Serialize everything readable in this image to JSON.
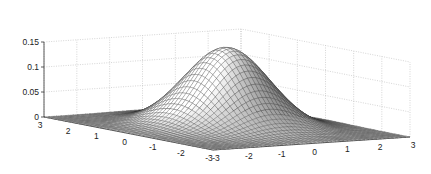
{
  "chart_data": {
    "type": "surface",
    "title": "",
    "xlabel": "",
    "ylabel": "",
    "zlabel": "",
    "function": "bivariate standard normal density z = exp(-(x^2+y^2)/2) / (2*pi)",
    "x_range": [
      -3,
      3
    ],
    "y_range": [
      -3,
      3
    ],
    "zlim": [
      0,
      0.15
    ],
    "grid_on": true,
    "mesh_resolution": 49,
    "x_ticks": [
      -3,
      -2,
      -1,
      0,
      1,
      2,
      3
    ],
    "x_tick_labels": [
      "-3",
      "-2",
      "-1",
      "0",
      "1",
      "2",
      "3"
    ],
    "y_ticks": [
      -3,
      -2,
      -1,
      0,
      1,
      2,
      3
    ],
    "y_tick_labels": [
      "-3",
      "-2",
      "-1",
      "0",
      "1",
      "2",
      "3"
    ],
    "z_ticks": [
      0,
      0.05,
      0.1,
      0.15
    ],
    "z_tick_labels": [
      "0",
      "0.05",
      "0.1",
      "0.15"
    ],
    "peak": {
      "x": 0,
      "y": 0,
      "z": 0.159
    },
    "colormap": "grayscale",
    "edge_color": "#333333"
  },
  "projection": {
    "left_corner": [
      44,
      117
    ],
    "front_corner": [
      213,
      150
    ],
    "right_corner": [
      410,
      137
    ],
    "z_pixels_per_unit": 500
  }
}
